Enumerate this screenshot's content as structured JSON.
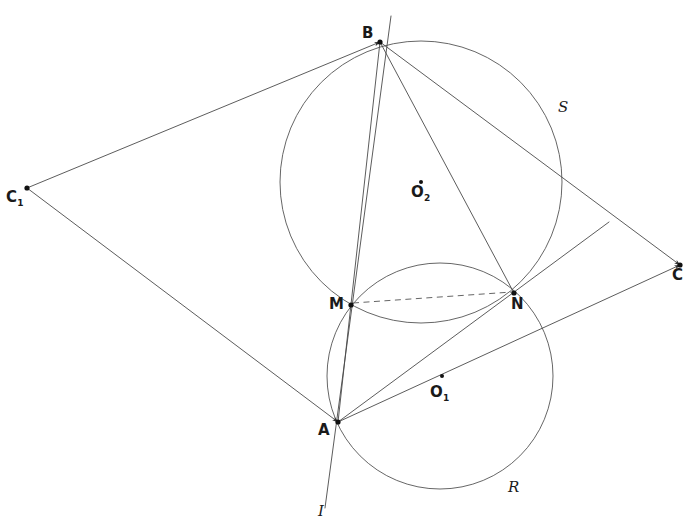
{
  "figure": {
    "width": 692,
    "height": 530,
    "background": "#ffffff",
    "line_color": "#4a4a4a",
    "label_color": "#1a1a1a",
    "dashed_color": "#666666"
  },
  "points": [
    {
      "id": "B",
      "label": "B",
      "sub": "",
      "x": 380,
      "y": 42,
      "label_x": 362,
      "label_y": 26,
      "dot": true
    },
    {
      "id": "C1",
      "label": "C",
      "sub": "1",
      "x": 27,
      "y": 188,
      "label_x": 6,
      "label_y": 190,
      "dot": true
    },
    {
      "id": "C",
      "label": "C",
      "sub": "",
      "x": 680,
      "y": 265,
      "label_x": 672,
      "label_y": 268,
      "dot": true
    },
    {
      "id": "M",
      "label": "M",
      "sub": "",
      "x": 351,
      "y": 305,
      "label_x": 329,
      "label_y": 297,
      "dot": true
    },
    {
      "id": "N",
      "label": "N",
      "sub": "",
      "x": 514,
      "y": 293,
      "label_x": 511,
      "label_y": 297,
      "dot": true
    },
    {
      "id": "A",
      "label": "A",
      "sub": "",
      "x": 338,
      "y": 422,
      "label_x": 318,
      "label_y": 423,
      "dot": true
    }
  ],
  "centers": [
    {
      "id": "O2",
      "label": "O",
      "sub": "2",
      "x": 421,
      "y": 182,
      "label_x": 411,
      "label_y": 185,
      "dot": true
    },
    {
      "id": "O1",
      "label": "O",
      "sub": "1",
      "x": 442,
      "y": 376,
      "label_x": 430,
      "label_y": 385,
      "dot": true
    }
  ],
  "circles": [
    {
      "id": "S",
      "name": "circle-S",
      "cx": 421,
      "cy": 182,
      "r": 141
    },
    {
      "id": "R",
      "name": "circle-R",
      "cx": 440,
      "cy": 376,
      "r": 113
    }
  ],
  "circle_labels": [
    {
      "id": "S",
      "label": "S",
      "x": 558,
      "y": 100
    },
    {
      "id": "R",
      "label": "R",
      "x": 508,
      "y": 480
    }
  ],
  "segments": [
    {
      "id": "C1B",
      "name": "segment-C1-B",
      "x1": 27,
      "y1": 188,
      "x2": 380,
      "y2": 42,
      "arrow_at_end": true
    },
    {
      "id": "C1A",
      "name": "segment-C1-A",
      "x1": 27,
      "y1": 188,
      "x2": 338,
      "y2": 422,
      "arrow_at_end": true
    },
    {
      "id": "AC",
      "name": "segment-A-C",
      "x1": 338,
      "y1": 422,
      "x2": 680,
      "y2": 265,
      "arrow_at_end": true
    },
    {
      "id": "BC",
      "name": "segment-B-C",
      "x1": 380,
      "y1": 42,
      "x2": 680,
      "y2": 265,
      "arrow_at_end": true
    },
    {
      "id": "BA",
      "name": "segment-B-A",
      "x1": 380,
      "y1": 42,
      "x2": 338,
      "y2": 422,
      "arrow_at_end": false
    },
    {
      "id": "BN",
      "name": "segment-B-N",
      "x1": 380,
      "y1": 42,
      "x2": 514,
      "y2": 293,
      "arrow_at_end": false
    },
    {
      "id": "BMI",
      "name": "line-B-M-I",
      "x1": 391,
      "y1": 16,
      "x2": 325,
      "y2": 508,
      "arrow_at_end": false
    },
    {
      "id": "AN",
      "name": "line-A-N-ext",
      "x1": 338,
      "y1": 422,
      "x2": 609,
      "y2": 222,
      "arrow_at_end": false
    }
  ],
  "dashed_segments": [
    {
      "id": "MN",
      "name": "dashed-chord-M-N",
      "x1": 353,
      "y1": 303,
      "x2": 512,
      "y2": 292
    }
  ],
  "axis_label": {
    "id": "I",
    "label": "I",
    "x": 318,
    "y": 504
  },
  "notes": {
    "line_style": "thin grey pencil strokes",
    "dash_pattern": "6 4.5"
  }
}
